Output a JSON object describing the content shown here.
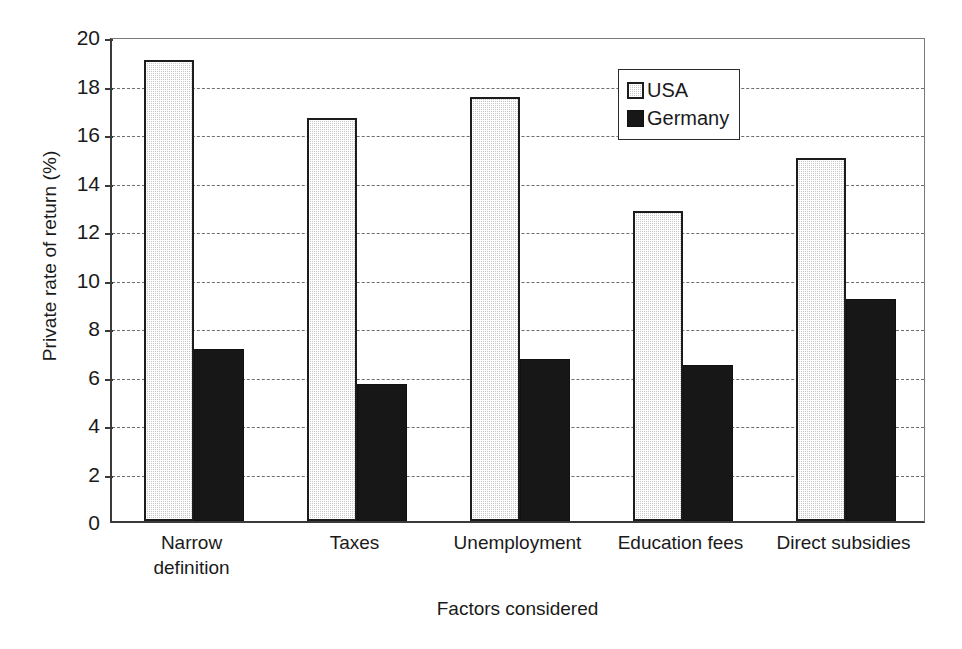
{
  "chart_data": {
    "type": "bar",
    "title": "",
    "xlabel": "Factors considered",
    "ylabel": "Private rate of return (%)",
    "ylim": [
      0,
      20
    ],
    "ytick_step": 2,
    "yticks": [
      0,
      2,
      4,
      6,
      8,
      10,
      12,
      14,
      16,
      18,
      20
    ],
    "ytick_labels": [
      "0",
      "2",
      "4",
      "6",
      "8",
      "10",
      "12",
      "14",
      "16",
      "18",
      "20"
    ],
    "grid": "horizontal-dashed",
    "legend_position": "top-right-inside",
    "categories": [
      "Narrow definition",
      "Taxes",
      "Unemployment",
      "Education fees",
      "Direct subsidies"
    ],
    "category_lines": [
      [
        "Narrow",
        "definition"
      ],
      [
        "Taxes"
      ],
      [
        "Unemployment"
      ],
      [
        "Education fees"
      ],
      [
        "Direct subsidies"
      ]
    ],
    "series": [
      {
        "name": "USA",
        "color": "#c9c9c9",
        "pattern": "stippled",
        "values": [
          19.0,
          16.6,
          17.5,
          12.8,
          14.95
        ]
      },
      {
        "name": "Germany",
        "color": "#171717",
        "pattern": "solid",
        "values": [
          7.1,
          5.65,
          6.7,
          6.45,
          9.15
        ]
      }
    ]
  },
  "legend": {
    "entries": [
      {
        "label": "USA",
        "swatch": "usa-swatch"
      },
      {
        "label": "Germany",
        "swatch": "germany-swatch"
      }
    ]
  }
}
